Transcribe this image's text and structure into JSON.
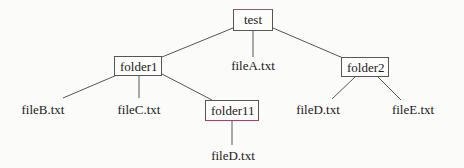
{
  "diagram": {
    "type": "directory-tree",
    "colors": {
      "line": "#555555",
      "box_border": "#555555",
      "accent": "#c4306a",
      "background": "#fbfbf9",
      "text": "#1a1a1a"
    },
    "nodes": {
      "test": {
        "label": "test",
        "kind": "folder"
      },
      "folder1": {
        "label": "folder1",
        "kind": "folder"
      },
      "fileA": {
        "label": "fileA.txt",
        "kind": "file"
      },
      "folder2": {
        "label": "folder2",
        "kind": "folder"
      },
      "fileB": {
        "label": "fileB.txt",
        "kind": "file"
      },
      "fileC": {
        "label": "fileC.txt",
        "kind": "file"
      },
      "folder11": {
        "label": "folder11",
        "kind": "folder"
      },
      "fileD_folder2": {
        "label": "fileD.txt",
        "kind": "file"
      },
      "fileE": {
        "label": "fileE.txt",
        "kind": "file"
      },
      "fileD_folder11": {
        "label": "fileD.txt",
        "kind": "file"
      }
    },
    "edges": [
      {
        "from": "test",
        "to": "folder1"
      },
      {
        "from": "test",
        "to": "fileA"
      },
      {
        "from": "test",
        "to": "folder2"
      },
      {
        "from": "folder1",
        "to": "fileB"
      },
      {
        "from": "folder1",
        "to": "fileC"
      },
      {
        "from": "folder1",
        "to": "folder11"
      },
      {
        "from": "folder2",
        "to": "fileD_folder2"
      },
      {
        "from": "folder2",
        "to": "fileE"
      },
      {
        "from": "folder11",
        "to": "fileD_folder11"
      }
    ]
  }
}
